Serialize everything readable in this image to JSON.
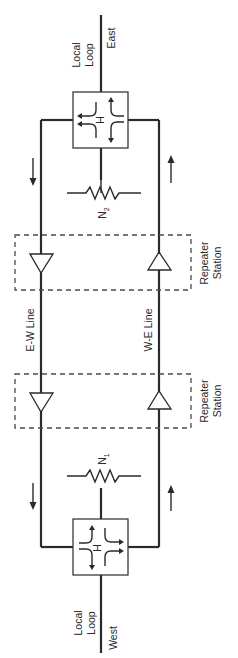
{
  "diagram": {
    "title": "",
    "orientation": "rotated-90",
    "colors": {
      "line": "#2a2a2a",
      "background": "#ffffff"
    },
    "nodes": {
      "east_endpoint": {
        "label": "East"
      },
      "west_endpoint": {
        "label": "West"
      },
      "east_local_loop": {
        "label_line1": "Local",
        "label_line2": "Loop"
      },
      "west_local_loop": {
        "label_line1": "Local",
        "label_line2": "Loop"
      },
      "east_hybrid": {
        "label": "H"
      },
      "west_hybrid": {
        "label": "H"
      },
      "balance_network_east": {
        "label": "N",
        "subscript": "2"
      },
      "balance_network_west": {
        "label": "N",
        "subscript": "1"
      },
      "repeater_station_east": {
        "label_line1": "Repeater",
        "label_line2": "Station"
      },
      "repeater_station_west": {
        "label_line1": "Repeater",
        "label_line2": "Station"
      },
      "ew_line": {
        "label": "E-W Line"
      },
      "we_line": {
        "label": "W-E Line"
      }
    },
    "edges": [
      {
        "from": "east_endpoint",
        "to": "east_hybrid",
        "via": "east_local_loop"
      },
      {
        "from": "east_hybrid",
        "to": "repeater_station_east",
        "line": "E-W Line",
        "direction": "east-to-west"
      },
      {
        "from": "repeater_station_east",
        "to": "repeater_station_west",
        "line": "E-W Line",
        "direction": "east-to-west"
      },
      {
        "from": "repeater_station_west",
        "to": "west_hybrid",
        "line": "E-W Line",
        "direction": "east-to-west"
      },
      {
        "from": "west_hybrid",
        "to": "repeater_station_west",
        "line": "W-E Line",
        "direction": "west-to-east"
      },
      {
        "from": "repeater_station_west",
        "to": "repeater_station_east",
        "line": "W-E Line",
        "direction": "west-to-east"
      },
      {
        "from": "repeater_station_east",
        "to": "east_hybrid",
        "line": "W-E Line",
        "direction": "west-to-east"
      },
      {
        "from": "east_hybrid",
        "to": "balance_network_east"
      },
      {
        "from": "west_hybrid",
        "to": "balance_network_west"
      },
      {
        "from": "west_hybrid",
        "to": "west_endpoint",
        "via": "west_local_loop"
      }
    ]
  }
}
